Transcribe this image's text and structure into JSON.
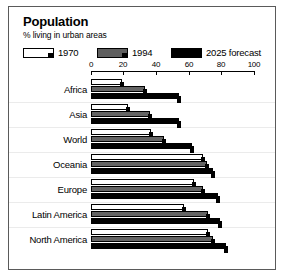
{
  "chart_data": {
    "type": "bar",
    "orientation": "horizontal",
    "title": "Population",
    "subtitle": "% living in urban areas",
    "xlabel": "",
    "ylabel": "",
    "xlim": [
      0,
      100
    ],
    "ticks": [
      0,
      20,
      40,
      60,
      80,
      100
    ],
    "tick_labels": [
      "0",
      "20",
      "40",
      "60",
      "80",
      "100"
    ],
    "grid": false,
    "legend_position": "top",
    "categories": [
      "Africa",
      "Asia",
      "World",
      "Oceania",
      "Europe",
      "Latin America",
      "North America"
    ],
    "series": [
      {
        "name": "1970",
        "color": "#ffffff",
        "values": [
          19,
          23,
          37,
          69,
          63,
          57,
          72
        ]
      },
      {
        "name": "1994",
        "color": "#646464",
        "values": [
          33,
          36,
          45,
          71,
          69,
          72,
          75
        ]
      },
      {
        "name": "2025 forecast",
        "color": "#000000",
        "values": [
          54,
          54,
          62,
          75,
          78,
          79,
          83
        ]
      }
    ]
  },
  "legend": {
    "items": [
      {
        "label": "1970",
        "swatch": "white"
      },
      {
        "label": "1994",
        "swatch": "gray"
      },
      {
        "label": "2025 forecast",
        "swatch": "black"
      }
    ]
  },
  "colors": {
    "series_1970": "#ffffff",
    "series_1994": "#646464",
    "series_2025": "#000000",
    "frame_border": "#5a5a5a",
    "background": "#ffffff",
    "text": "#000000"
  }
}
